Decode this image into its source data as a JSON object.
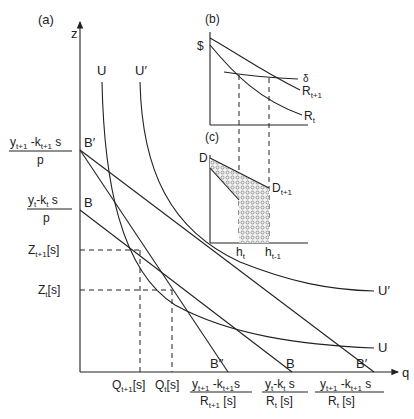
{
  "panels": {
    "a": {
      "label": "(a)",
      "y_axis": "z",
      "x_axis": "q",
      "curves": {
        "U": "U",
        "U_prime": "U′",
        "U_right": "U",
        "U_prime_right": "U′"
      },
      "budget_points": {
        "B_prime_top": "B′",
        "B_top": "B",
        "B_dprime_bottom": "B″",
        "B_bottom": "B",
        "B_prime_bottom": "B′"
      },
      "y_labels": {
        "top_num_1": "y",
        "top_num_1_sub": "t+1",
        "top_num_2": " -k",
        "top_num_2_sub": "t+1",
        "top_num_3": " s",
        "top_den": "p",
        "mid_num_1": "y",
        "mid_num_1_sub": "t",
        "mid_num_2": "-k",
        "mid_num_2_sub": "t",
        "mid_num_3": " s",
        "mid_den": "p",
        "z_t1": "Z",
        "z_t1_sub": "t+1",
        "z_t1_suffix": "[s]",
        "z_t": "Z",
        "z_t_sub": "t",
        "z_t_suffix": "[s]"
      },
      "x_labels": {
        "q_t1": "Q",
        "q_t1_sub": "t+1",
        "q_t1_suffix": "[s]",
        "q_t": "Q",
        "q_t_sub": "t",
        "q_t_suffix": "[s]",
        "f1_num": "y",
        "f1_num_sub": "t+1",
        "f1_num2": " -k",
        "f1_num2_sub": "t+1",
        "f1_num3": "s",
        "f1_den": "R",
        "f1_den_sub": "t+1",
        "f1_den2": " [s]",
        "f2_num": "y",
        "f2_num_sub": "t",
        "f2_num2": "-k",
        "f2_num2_sub": "t",
        "f2_num3": " s",
        "f2_den": "R",
        "f2_den_sub": "t",
        "f2_den2": " [s]",
        "f3_num": "y",
        "f3_num_sub": "t+1",
        "f3_num2": " -k",
        "f3_num2_sub": "t+1",
        "f3_num3": " s",
        "f3_den": "R",
        "f3_den_sub": "t",
        "f3_den2": " [s]"
      }
    },
    "b": {
      "label": "(b)",
      "y_axis": "$",
      "curves": {
        "delta": "δ",
        "R_t1": "R",
        "R_t1_sub": "t+1",
        "R_t": "R",
        "R_t_sub": "t"
      }
    },
    "c": {
      "label": "(c)",
      "y_axis": "D",
      "curves": {
        "D_t1": "D",
        "D_t1_sub": "t+1"
      },
      "x_labels": {
        "h_t": "h",
        "h_t_sub": "t",
        "h_t1": "h",
        "h_t1_sub": "t-1"
      }
    }
  },
  "colors": {
    "ink": "#222222",
    "background": "#ffffff",
    "hatch": "#888888"
  }
}
